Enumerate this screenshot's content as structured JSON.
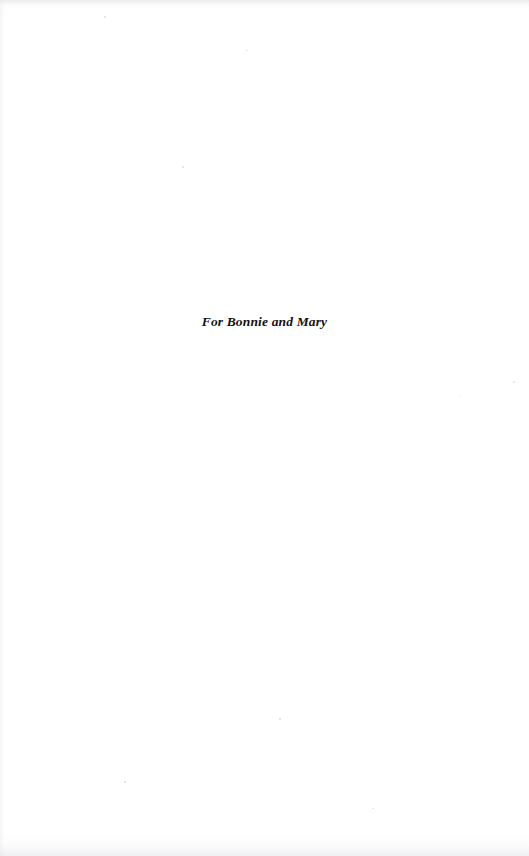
{
  "page": {
    "kind": "book-dedication-page",
    "width": 529,
    "height": 856,
    "background_color": "#ffffff"
  },
  "dedication": {
    "text": "For Bonnie and Mary",
    "text_color": "#121212",
    "alignment": "center"
  }
}
